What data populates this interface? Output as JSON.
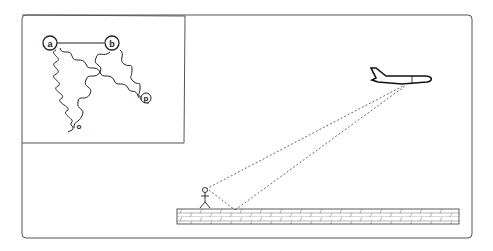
{
  "figure": {
    "inset": {
      "nodes": [
        {
          "id": "a",
          "label": "a"
        },
        {
          "id": "b",
          "label": "b"
        },
        {
          "id": "o",
          "label": "o"
        },
        {
          "id": "p",
          "label": "p"
        }
      ],
      "edges": [
        {
          "from": "a",
          "to": "b",
          "style": "solid"
        },
        {
          "from": "a",
          "to": "o",
          "style": "wavy"
        },
        {
          "from": "a",
          "to": "p",
          "style": "wavy"
        },
        {
          "from": "b",
          "to": "o",
          "style": "wavy"
        },
        {
          "from": "b",
          "to": "p",
          "style": "wavy"
        }
      ]
    },
    "main": {
      "objects": [
        "airplane",
        "person",
        "brick-wall"
      ],
      "sight_lines": [
        "direct-path",
        "reflected-path"
      ]
    },
    "colors": {
      "stroke": "#222222",
      "frame": "#555555",
      "background": "#ffffff"
    }
  }
}
